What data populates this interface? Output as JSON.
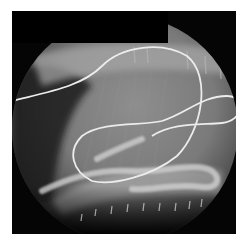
{
  "image": {
    "kind": "fluoroscopy-xray",
    "description": "Circular fluoroscopic X-ray field showing a coiled looped catheter/wire overlying soft tissue and rib-like structures",
    "colors": {
      "background": "#ffffff",
      "frame": "#050505",
      "tissue_light": "#9a9a9a",
      "tissue_dark": "#3a3a3a",
      "wire": "#e8e8e8",
      "mask": "#000000"
    }
  }
}
